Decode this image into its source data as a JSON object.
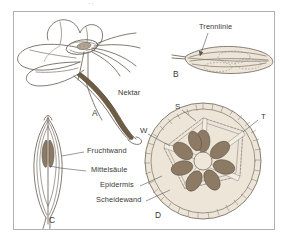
{
  "figure": {
    "scan_mark": "··",
    "panels": [
      {
        "id": "A",
        "name": "flower-with-nectar-spur",
        "caption": "A",
        "x": 92,
        "y": 113
      },
      {
        "id": "B",
        "name": "fruit-side-view-dehiscence",
        "caption": "B",
        "x": 173,
        "y": 74
      },
      {
        "id": "C",
        "name": "fruit-longitudinal-section",
        "caption": "C",
        "x": 49,
        "y": 220
      },
      {
        "id": "D",
        "name": "fruit-cross-section",
        "caption": "D",
        "x": 155,
        "y": 215
      }
    ],
    "labels": [
      {
        "key": "nektar",
        "text": "Nektar",
        "x": 118,
        "y": 93,
        "panel": "A"
      },
      {
        "key": "trennlinie",
        "text": "Trennlinie",
        "x": 199,
        "y": 27,
        "panel": "B"
      },
      {
        "key": "fruchtwand",
        "text": "Fruchtwand",
        "x": 87,
        "y": 150,
        "panel": "C"
      },
      {
        "key": "mittelsaule",
        "text": "Mittelsäule",
        "x": 91,
        "y": 169,
        "panel": "C"
      },
      {
        "key": "epidermis",
        "text": "Epidermis",
        "x": 100,
        "y": 184,
        "panel": "D"
      },
      {
        "key": "scheidewand",
        "text": "Scheidewand",
        "x": 96,
        "y": 199,
        "panel": "D"
      }
    ],
    "letter_tags": [
      {
        "key": "S",
        "text": "S",
        "x": 175,
        "y": 107,
        "panel": "D"
      },
      {
        "key": "T",
        "text": "T",
        "x": 261,
        "y": 117,
        "panel": "D"
      },
      {
        "key": "W",
        "text": "W",
        "x": 140,
        "y": 131,
        "panel": "D"
      }
    ],
    "colors": {
      "background": "#ffffff",
      "frame_border": "#b0b0b0",
      "line": "#6b6257",
      "line_light": "#8d8madd",
      "nectar_fill": "#6f5c44",
      "seed_fill": "#8c7a64",
      "seed_fill_light": "#b5a693",
      "wall_fill": "#ece5d8",
      "pith_fill": "#e9e1d2",
      "text": "#383838"
    }
  }
}
